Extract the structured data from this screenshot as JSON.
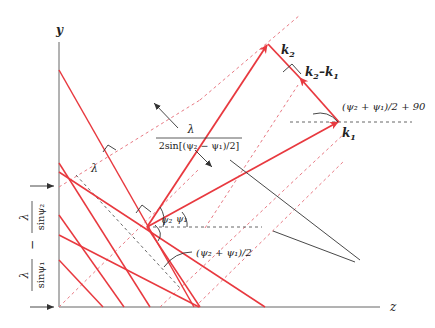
{
  "figure": {
    "axes": {
      "y_label": "y",
      "z_label": "z"
    },
    "vectors": {
      "k1_label": "k",
      "k1_sub": "1",
      "k2_label": "k",
      "k2_sub": "2",
      "diff_label_a": "k",
      "diff_sub_a": "2",
      "diff_dash": "–",
      "diff_label_b": "k",
      "diff_sub_b": "1"
    },
    "annotations": {
      "spacing_numer": "λ",
      "spacing_denom": "2sin[(ψ₂ − ψ₁)/2]",
      "lambda_small": "λ",
      "angle_sum_half": "(ψ₂ + ψ₁)/2",
      "angle_sum_half_plus90": "(ψ₂ + ψ₁)/2 + 90",
      "psi1": "ψ₁",
      "psi2": "ψ₂",
      "vertical_spacing_a_numer": "λ",
      "vertical_spacing_a_denom": "sinψ₁",
      "vertical_spacing_minus": "−",
      "vertical_spacing_b_numer": "λ",
      "vertical_spacing_b_denom": "sinψ₂"
    },
    "colors": {
      "wave": "#e8393f",
      "dashed_wave": "#e87a84",
      "axis": "#555555",
      "guide": "#555555"
    }
  }
}
